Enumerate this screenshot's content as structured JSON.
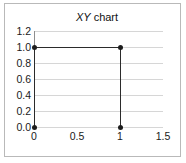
{
  "chart_data": {
    "type": "line",
    "title": "XY chart",
    "title_italic_part": "XY",
    "title_regular_part": " chart",
    "xlabel": "",
    "ylabel": "",
    "xlim": [
      0,
      1.5
    ],
    "ylim": [
      0.0,
      1.2
    ],
    "grid": true,
    "grid_axis": "y",
    "legend": false,
    "markers": true,
    "series": [
      {
        "name": "XY",
        "x": [
          0,
          0,
          1,
          1
        ],
        "y": [
          0.0,
          1.0,
          1.0,
          0.0
        ],
        "color": "#2b2b2b"
      }
    ],
    "x_ticks": [
      0,
      0.5,
      1,
      1.5
    ],
    "x_tick_labels": [
      "0",
      "0.5",
      "1",
      "1.5"
    ],
    "y_ticks": [
      0.0,
      0.2,
      0.4,
      0.6,
      0.8,
      1.0,
      1.2
    ],
    "y_tick_labels": [
      "0.0",
      "0.2",
      "0.4",
      "0.6",
      "0.8",
      "1.0",
      "1.2"
    ]
  },
  "colors": {
    "frame_border": "#b9b9b9",
    "gridline": "#d6d6d6",
    "axis": "#8f8f8f",
    "series": "#2b2b2b",
    "marker": "#1c1c1c",
    "text": "#1a1a1a",
    "background": "#ffffff"
  }
}
